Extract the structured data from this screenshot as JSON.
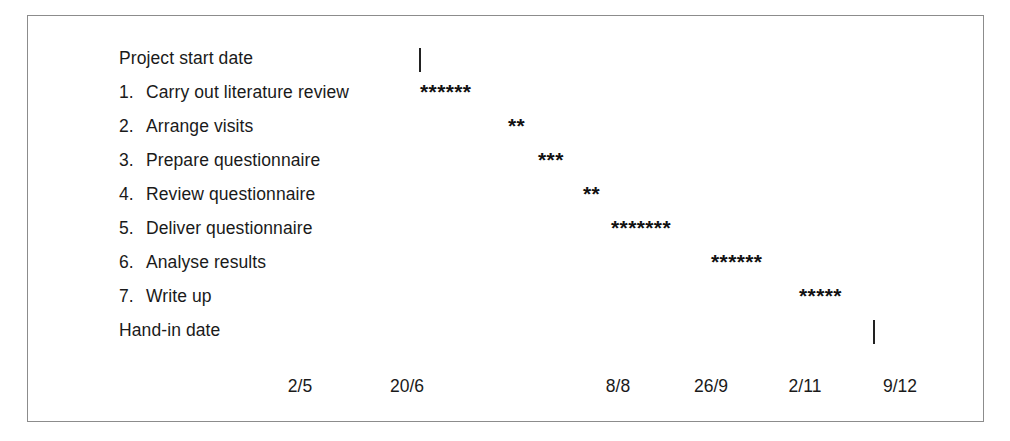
{
  "chart_data": {
    "type": "bar",
    "title": "",
    "subtitle": "",
    "xlabel": "",
    "ylabel": "",
    "orientation": "horizontal",
    "grid": false,
    "legend": null,
    "axis": {
      "tick_labels": [
        "2/5",
        "20/6",
        "8/8",
        "26/9",
        "2/11",
        "9/12"
      ],
      "tick_positions_px": [
        272,
        379,
        590,
        683,
        777,
        872
      ]
    },
    "categories": [
      "Project start date",
      "1.  Carry out literature review",
      "2.  Arrange visits",
      "3.  Prepare questionnaire",
      "4.  Review questionnaire",
      "5.  Deliver questionnaire",
      "6.  Analyse results",
      "7.  Write up",
      "Hand-in date"
    ],
    "values": [
      0,
      6,
      2,
      3,
      2,
      7,
      6,
      5,
      0
    ],
    "bar_glyph": "*",
    "series": [
      {
        "name": "Task duration (weeks, marked with asterisks)",
        "values": [
          0,
          6,
          2,
          3,
          2,
          7,
          6,
          5,
          0
        ]
      }
    ]
  },
  "frame": {
    "border_color": "#8c8c8c",
    "background": "#ffffff"
  },
  "rows": [
    {
      "number": "",
      "label": "Project start date",
      "bar": "",
      "bar_count": 0,
      "bar_left": 0,
      "milestone": true,
      "milestone_left": 391,
      "top": 25
    },
    {
      "number": "1.",
      "label": "Carry out literature review",
      "bar": "******",
      "bar_count": 6,
      "bar_left": 392,
      "milestone": false,
      "milestone_left": 0,
      "top": 59
    },
    {
      "number": "2.",
      "label": "Arrange visits",
      "bar": "**",
      "bar_count": 2,
      "bar_left": 480,
      "milestone": false,
      "milestone_left": 0,
      "top": 93
    },
    {
      "number": "3.",
      "label": "Prepare questionnaire",
      "bar": "***",
      "bar_count": 3,
      "bar_left": 510,
      "milestone": false,
      "milestone_left": 0,
      "top": 127
    },
    {
      "number": "4.",
      "label": "Review questionnaire",
      "bar": "**",
      "bar_count": 2,
      "bar_left": 555,
      "milestone": false,
      "milestone_left": 0,
      "top": 161
    },
    {
      "number": "5.",
      "label": "Deliver questionnaire",
      "bar": "*******",
      "bar_count": 7,
      "bar_left": 583,
      "milestone": false,
      "milestone_left": 0,
      "top": 195
    },
    {
      "number": "6.",
      "label": "Analyse results",
      "bar": "******",
      "bar_count": 6,
      "bar_left": 683,
      "milestone": false,
      "milestone_left": 0,
      "top": 229
    },
    {
      "number": "7.",
      "label": "Write up",
      "bar": "*****",
      "bar_count": 5,
      "bar_left": 771,
      "milestone": false,
      "milestone_left": 0,
      "top": 263
    },
    {
      "number": "",
      "label": "Hand-in date",
      "bar": "",
      "bar_count": 0,
      "bar_left": 0,
      "milestone": true,
      "milestone_left": 845,
      "top": 297
    }
  ],
  "axis": {
    "labels": [
      {
        "text": "2/5",
        "left": 245
      },
      {
        "text": "20/6",
        "left": 352
      },
      {
        "text": "8/8",
        "left": 563
      },
      {
        "text": "26/9",
        "left": 656
      },
      {
        "text": "2/11",
        "left": 750
      },
      {
        "text": "9/12",
        "left": 845
      }
    ]
  }
}
